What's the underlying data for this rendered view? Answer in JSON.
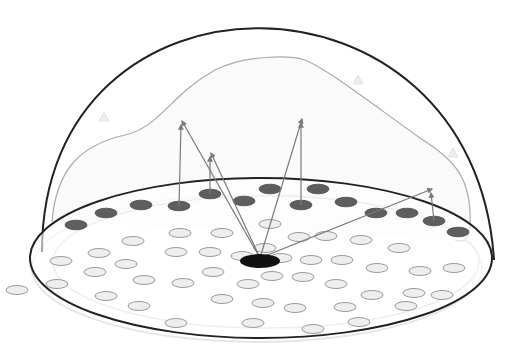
{
  "diagram": {
    "colors": {
      "background": "#ffffff",
      "dome_outline": "#222222",
      "envelope": "#aaaaaa",
      "dark_cell": "#5e5e5e",
      "light_cell_fill": "#eeeeee",
      "light_cell_stroke": "#9a9a9a",
      "arrow": "#7a7a7a",
      "source": "#111111"
    },
    "dome": {
      "cx": 258,
      "base_y": 252,
      "rx": 216,
      "top_y": 25
    },
    "base": {
      "cx": 261,
      "cy": 258,
      "rx": 231,
      "ry": 80
    },
    "source": {
      "x": 260,
      "y": 261,
      "rx": 20,
      "ry": 7
    },
    "dark_cells": [
      {
        "x": 76,
        "y": 225
      },
      {
        "x": 106,
        "y": 213
      },
      {
        "x": 141,
        "y": 205
      },
      {
        "x": 179,
        "y": 206
      },
      {
        "x": 210,
        "y": 194
      },
      {
        "x": 244,
        "y": 201
      },
      {
        "x": 270,
        "y": 189
      },
      {
        "x": 301,
        "y": 205
      },
      {
        "x": 318,
        "y": 189
      },
      {
        "x": 346,
        "y": 202
      },
      {
        "x": 376,
        "y": 213
      },
      {
        "x": 407,
        "y": 213
      },
      {
        "x": 434,
        "y": 221
      },
      {
        "x": 458,
        "y": 232
      }
    ],
    "light_cells": [
      {
        "x": 180,
        "y": 233
      },
      {
        "x": 222,
        "y": 233
      },
      {
        "x": 133,
        "y": 241
      },
      {
        "x": 270,
        "y": 224
      },
      {
        "x": 299,
        "y": 237
      },
      {
        "x": 326,
        "y": 236
      },
      {
        "x": 361,
        "y": 240
      },
      {
        "x": 399,
        "y": 248
      },
      {
        "x": 99,
        "y": 253
      },
      {
        "x": 176,
        "y": 252
      },
      {
        "x": 210,
        "y": 252
      },
      {
        "x": 242,
        "y": 256
      },
      {
        "x": 281,
        "y": 258
      },
      {
        "x": 311,
        "y": 260
      },
      {
        "x": 342,
        "y": 260
      },
      {
        "x": 61,
        "y": 261
      },
      {
        "x": 126,
        "y": 264
      },
      {
        "x": 377,
        "y": 268
      },
      {
        "x": 420,
        "y": 271
      },
      {
        "x": 454,
        "y": 268
      },
      {
        "x": 95,
        "y": 272
      },
      {
        "x": 144,
        "y": 280
      },
      {
        "x": 213,
        "y": 272
      },
      {
        "x": 272,
        "y": 276
      },
      {
        "x": 303,
        "y": 277
      },
      {
        "x": 336,
        "y": 284
      },
      {
        "x": 57,
        "y": 284
      },
      {
        "x": 183,
        "y": 283
      },
      {
        "x": 248,
        "y": 284
      },
      {
        "x": 372,
        "y": 295
      },
      {
        "x": 414,
        "y": 293
      },
      {
        "x": 106,
        "y": 296
      },
      {
        "x": 139,
        "y": 306
      },
      {
        "x": 222,
        "y": 299
      },
      {
        "x": 263,
        "y": 303
      },
      {
        "x": 295,
        "y": 308
      },
      {
        "x": 345,
        "y": 307
      },
      {
        "x": 442,
        "y": 295
      },
      {
        "x": 406,
        "y": 306
      },
      {
        "x": 176,
        "y": 323
      },
      {
        "x": 253,
        "y": 323
      },
      {
        "x": 313,
        "y": 329
      },
      {
        "x": 359,
        "y": 322
      },
      {
        "x": 265,
        "y": 248
      },
      {
        "x": 17,
        "y": 290
      }
    ],
    "arrows": [
      {
        "from": [
          260,
          258
        ],
        "to": [
          182,
          121
        ],
        "base": [
          179,
          206
        ]
      },
      {
        "from": [
          260,
          258
        ],
        "to": [
          211,
          153
        ],
        "base": [
          210,
          194
        ]
      },
      {
        "from": [
          260,
          258
        ],
        "to": [
          302,
          119
        ],
        "base": [
          301,
          205
        ]
      },
      {
        "from": [
          260,
          258
        ],
        "to": [
          432,
          189
        ],
        "base": [
          434,
          221
        ]
      }
    ],
    "faint_markers": [
      {
        "x": 104,
        "y": 117
      },
      {
        "x": 358,
        "y": 80
      },
      {
        "x": 453,
        "y": 153
      }
    ]
  }
}
